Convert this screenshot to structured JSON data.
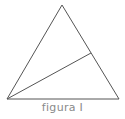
{
  "figure": {
    "caption": "figura I",
    "stroke_color": "#555555",
    "triangle": {
      "apex": [
        62,
        5
      ],
      "bottom_left": [
        7,
        99
      ],
      "bottom_right": [
        119,
        99
      ]
    },
    "cevian": {
      "from": [
        7,
        99
      ],
      "to": [
        91,
        53
      ]
    }
  }
}
